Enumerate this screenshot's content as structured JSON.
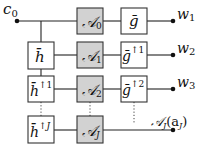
{
  "diagram": {
    "input": {
      "label": "c",
      "subscript": "0"
    },
    "outputs": [
      {
        "label": "w",
        "subscript": "1"
      },
      {
        "label": "w",
        "subscript": "2"
      },
      {
        "label": "w",
        "subscript": "3"
      },
      {
        "label": "𝒜",
        "subscript": "J",
        "arg": "(a",
        "arg_sub": "J",
        "arg_close": ")"
      }
    ],
    "h_boxes": [
      {
        "label": "h̄",
        "superscript": ""
      },
      {
        "label": "h̄",
        "superscript": "↑1"
      },
      {
        "label": "h̄",
        "superscript": "↑J"
      }
    ],
    "a_boxes": [
      {
        "label": "𝒜",
        "subscript": "0"
      },
      {
        "label": "𝒜",
        "subscript": "1"
      },
      {
        "label": "𝒜",
        "subscript": "2"
      },
      {
        "label": "𝒜",
        "subscript": "J"
      }
    ],
    "g_boxes": [
      {
        "label": "ḡ",
        "superscript": ""
      },
      {
        "label": "ḡ",
        "superscript": "↑1"
      },
      {
        "label": "ḡ",
        "superscript": "↑2"
      }
    ],
    "colors": {
      "a_box_fill": "#d2d2d2",
      "other_box_fill": "#ffffff",
      "line": "#222222"
    }
  }
}
